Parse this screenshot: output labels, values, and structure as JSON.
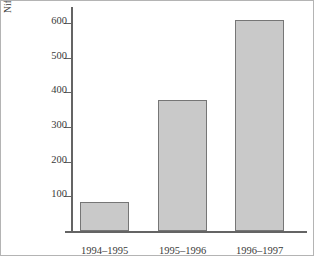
{
  "chart_data": {
    "type": "bar",
    "title": "",
    "subtitle": "",
    "xlabel": "",
    "ylabel_line1": "Nifer o blant mewn ysgolion meithrin",
    "ylabel_line2": "(miloedd)",
    "categories": [
      "1994–1995",
      "1995–1996",
      "1996–1997"
    ],
    "values": [
      85,
      378,
      608
    ],
    "series": [
      {
        "name": "Nifer o blant mewn ysgolion meithrin (miloedd)",
        "values": [
          85,
          378,
          608
        ]
      }
    ],
    "ylim": [
      0,
      640
    ],
    "yticks": [
      100,
      200,
      300,
      400,
      500,
      600
    ],
    "ytick_labels": [
      "100",
      "200",
      "300",
      "400",
      "500",
      "600"
    ],
    "grid": false,
    "legend": false,
    "legend_position": "none",
    "bar_fill_color": "#c9c9c9",
    "bar_edge_color": "#767676",
    "axis_color": "#646464",
    "text_color": "#3a3a3a",
    "background_color": "#ffffff",
    "border_color": "#b4b4b4"
  }
}
